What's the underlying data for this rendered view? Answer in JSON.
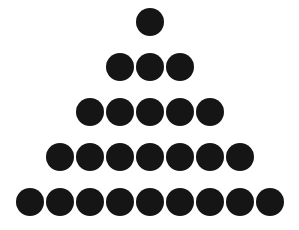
{
  "canvas": {
    "width": 299,
    "height": 230,
    "background_color": "#ffffff"
  },
  "figure": {
    "shape": "triangle",
    "dot_color": "#151515",
    "dot_diameter_px": 28,
    "horizontal_pitch_px": 30,
    "vertical_pitch_px": 45,
    "first_row_top_px": 8,
    "center_x_px": 151,
    "total_dots": 25,
    "row_count": 5
  },
  "chart_data": {
    "type": "scatter",
    "subtitle": "",
    "xlabel": "",
    "ylabel": "",
    "xlim": [
      0,
      299
    ],
    "ylim": [
      0,
      230
    ],
    "grid": false,
    "legend": "none",
    "marker": "filled-circle",
    "marker_color": "#151515",
    "marker_diameter_px": 28,
    "categories": [
      "row 1",
      "row 2",
      "row 3",
      "row 4",
      "row 5"
    ],
    "values": [
      1,
      3,
      5,
      7,
      9
    ],
    "annotations": [],
    "rows": [
      {
        "index": 1,
        "count": 1,
        "top_px": 8,
        "center_y_px": 22,
        "start_x_px": 137,
        "end_x_px": 165
      },
      {
        "index": 2,
        "count": 3,
        "top_px": 53,
        "center_y_px": 67,
        "start_x_px": 107,
        "end_x_px": 193
      },
      {
        "index": 3,
        "count": 5,
        "top_px": 98,
        "center_y_px": 112,
        "start_x_px": 77,
        "end_x_px": 224
      },
      {
        "index": 4,
        "count": 7,
        "top_px": 143,
        "center_y_px": 157,
        "start_x_px": 47,
        "end_x_px": 255
      },
      {
        "index": 5,
        "count": 9,
        "top_px": 188,
        "center_y_px": 202,
        "start_x_px": 17,
        "end_x_px": 285
      }
    ],
    "points": [
      {
        "x": 151,
        "y": 22
      },
      {
        "x": 121,
        "y": 67
      },
      {
        "x": 151,
        "y": 67
      },
      {
        "x": 181,
        "y": 67
      },
      {
        "x": 91,
        "y": 112
      },
      {
        "x": 121,
        "y": 112
      },
      {
        "x": 151,
        "y": 112
      },
      {
        "x": 181,
        "y": 112
      },
      {
        "x": 211,
        "y": 112
      },
      {
        "x": 61,
        "y": 157
      },
      {
        "x": 91,
        "y": 157
      },
      {
        "x": 121,
        "y": 157
      },
      {
        "x": 151,
        "y": 157
      },
      {
        "x": 181,
        "y": 157
      },
      {
        "x": 211,
        "y": 157
      },
      {
        "x": 241,
        "y": 157
      },
      {
        "x": 31,
        "y": 202
      },
      {
        "x": 61,
        "y": 202
      },
      {
        "x": 91,
        "y": 202
      },
      {
        "x": 121,
        "y": 202
      },
      {
        "x": 151,
        "y": 202
      },
      {
        "x": 181,
        "y": 202
      },
      {
        "x": 211,
        "y": 202
      },
      {
        "x": 241,
        "y": 202
      },
      {
        "x": 271,
        "y": 202
      }
    ]
  }
}
